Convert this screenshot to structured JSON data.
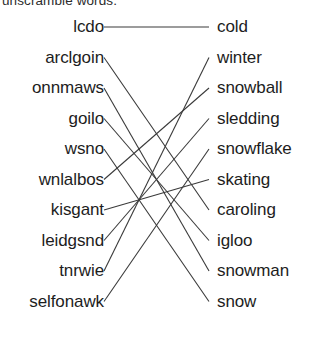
{
  "worksheet": {
    "instruction": "unscramble words.",
    "title": "Winter Word Scramble Matching",
    "left_column_label": "scrambled-words",
    "right_column_label": "solution-words",
    "geometry": {
      "first_row_y": 27,
      "row_spacing": 30.5,
      "left_anchor_x": 104,
      "right_anchor_x": 209
    },
    "left_words": [
      {
        "text": "lcdo",
        "row": 0
      },
      {
        "text": "arclgoin",
        "row": 1
      },
      {
        "text": "onnmaws",
        "row": 2
      },
      {
        "text": "goilo",
        "row": 3
      },
      {
        "text": "wsno",
        "row": 4
      },
      {
        "text": "wnlalbos",
        "row": 5
      },
      {
        "text": "kisgant",
        "row": 6
      },
      {
        "text": "leidgsnd",
        "row": 7
      },
      {
        "text": "tnrwie",
        "row": 8
      },
      {
        "text": "selfonawk",
        "row": 9
      }
    ],
    "right_words": [
      {
        "text": "cold",
        "row": 0
      },
      {
        "text": "winter",
        "row": 1
      },
      {
        "text": "snowball",
        "row": 2
      },
      {
        "text": "sledding",
        "row": 3
      },
      {
        "text": "snowflake",
        "row": 4
      },
      {
        "text": "skating",
        "row": 5
      },
      {
        "text": "caroling",
        "row": 6
      },
      {
        "text": "igloo",
        "row": 7
      },
      {
        "text": "snowman",
        "row": 8
      },
      {
        "text": "snow",
        "row": 9
      }
    ],
    "connections": [
      {
        "from": 0,
        "to": 0,
        "from_word": "lcdo",
        "to_word": "cold"
      },
      {
        "from": 1,
        "to": 6,
        "from_word": "arclgoin",
        "to_word": "caroling"
      },
      {
        "from": 2,
        "to": 8,
        "from_word": "onnmaws",
        "to_word": "snowman"
      },
      {
        "from": 3,
        "to": 7,
        "from_word": "goilo",
        "to_word": "igloo"
      },
      {
        "from": 4,
        "to": 9,
        "from_word": "wsno",
        "to_word": "snow"
      },
      {
        "from": 5,
        "to": 2,
        "from_word": "wnlalbos",
        "to_word": "snowball"
      },
      {
        "from": 6,
        "to": 5,
        "from_word": "kisgant",
        "to_word": "skating"
      },
      {
        "from": 7,
        "to": 3,
        "from_word": "leidgsnd",
        "to_word": "sledding"
      },
      {
        "from": 8,
        "to": 1,
        "from_word": "tnrwie",
        "to_word": "winter"
      },
      {
        "from": 9,
        "to": 4,
        "from_word": "selfonawk",
        "to_word": "snowflake"
      }
    ],
    "colors": {
      "text": "#1d1d1d",
      "line": "#3a3a3a",
      "background": "#ffffff"
    }
  }
}
